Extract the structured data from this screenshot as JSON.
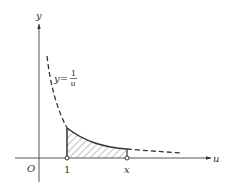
{
  "diagram": {
    "axes": {
      "x_label": "u",
      "y_label": "y",
      "origin_label": "O"
    },
    "curve_label": {
      "lhs": "y=",
      "numerator": "1",
      "denominator": "u"
    },
    "points": {
      "lower_bound": "1",
      "upper_bound": "x"
    },
    "colors": {
      "stroke": "#333333",
      "axis": "#555555",
      "hatch": "#666666"
    }
  }
}
